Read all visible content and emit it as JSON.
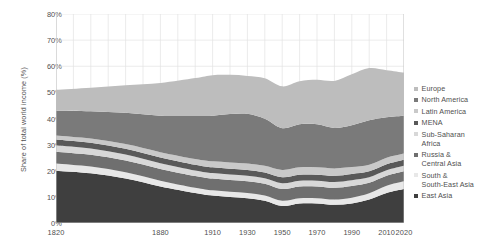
{
  "chart_data": {
    "type": "area",
    "stacked": true,
    "title": "",
    "subtitle": "",
    "xlabel": "",
    "ylabel": "Share of total world income (%)",
    "xlim": [
      1820,
      2020
    ],
    "ylim": [
      0,
      80
    ],
    "grid": true,
    "grid_axes": "both",
    "legend_position": "right",
    "x_tick_labels": [
      "1820",
      "1880",
      "1910",
      "1930",
      "1950",
      "1970",
      "1990",
      "2010",
      "2020"
    ],
    "x_tick_values": [
      1820,
      1880,
      1910,
      1930,
      1950,
      1970,
      1990,
      2010,
      2020
    ],
    "y_tick_labels": [
      "0%",
      "10%",
      "20%",
      "30%",
      "40%",
      "50%",
      "60%",
      "70%",
      "80%"
    ],
    "y_tick_values": [
      0,
      10,
      20,
      30,
      40,
      50,
      60,
      70,
      80
    ],
    "x": [
      1820,
      1840,
      1860,
      1880,
      1900,
      1910,
      1920,
      1930,
      1940,
      1950,
      1960,
      1970,
      1980,
      1990,
      2000,
      2010,
      2020
    ],
    "series": [
      {
        "name": "East Asia",
        "color": "#3f3f3f",
        "values": [
          20.0,
          19.0,
          17.0,
          14.0,
          11.5,
          10.5,
          10.0,
          9.5,
          8.5,
          6.5,
          7.5,
          7.5,
          7.0,
          7.5,
          9.0,
          11.5,
          13.0
        ]
      },
      {
        "name": "South & South-East Asia",
        "color": "#e8e8e8",
        "values": [
          2.8,
          2.6,
          2.4,
          2.2,
          2.0,
          2.0,
          2.0,
          2.0,
          2.0,
          2.0,
          2.0,
          2.0,
          2.0,
          2.2,
          2.4,
          2.8,
          3.0
        ]
      },
      {
        "name": "Russia & Central Asia",
        "color": "#6f6f6f",
        "values": [
          4.5,
          4.5,
          4.5,
          4.5,
          4.5,
          4.5,
          4.5,
          4.5,
          4.5,
          4.5,
          4.5,
          4.5,
          4.5,
          4.5,
          4.0,
          3.8,
          3.8
        ]
      },
      {
        "name": "Sub-Saharan Africa",
        "color": "#d8d8d8",
        "values": [
          2.5,
          2.4,
          2.3,
          2.2,
          2.1,
          2.1,
          2.1,
          2.1,
          2.1,
          2.2,
          2.2,
          2.2,
          2.2,
          2.2,
          2.1,
          2.1,
          2.1
        ]
      },
      {
        "name": "MENA",
        "color": "#595959",
        "values": [
          2.2,
          2.2,
          2.2,
          2.2,
          2.2,
          2.2,
          2.2,
          2.2,
          2.2,
          2.3,
          2.3,
          2.3,
          2.4,
          2.4,
          2.3,
          2.3,
          2.3
        ]
      },
      {
        "name": "Latin America",
        "color": "#c9c9c9",
        "values": [
          1.5,
          1.6,
          1.8,
          2.0,
          2.2,
          2.3,
          2.4,
          2.5,
          2.6,
          2.8,
          2.8,
          2.8,
          2.8,
          2.6,
          2.5,
          2.5,
          2.4
        ]
      },
      {
        "name": "North America",
        "color": "#7a7a7a",
        "values": [
          9.5,
          10.5,
          12.0,
          14.0,
          16.5,
          17.5,
          18.5,
          19.0,
          18.0,
          16.0,
          16.5,
          16.5,
          15.5,
          16.0,
          17.0,
          15.5,
          14.5
        ]
      },
      {
        "name": "Europe",
        "color": "#bdbdbd",
        "values": [
          8.0,
          9.0,
          10.5,
          12.5,
          14.5,
          15.5,
          15.0,
          14.5,
          15.5,
          16.0,
          16.5,
          17.0,
          18.0,
          19.5,
          20.0,
          18.0,
          16.5
        ]
      }
    ],
    "totals_note": "Stacked bands sum to roughly 51% at 1820, dipping near 47% around 1930, peaking near 60% around 2000 and ending near 55% at 2020."
  },
  "legend": {
    "items": [
      {
        "label": "Europe",
        "color": "#bdbdbd"
      },
      {
        "label": "North America",
        "color": "#7a7a7a"
      },
      {
        "label": "Latin America",
        "color": "#c9c9c9"
      },
      {
        "label": "MENA",
        "color": "#595959"
      },
      {
        "label": "Sub-Saharan\nAfrica",
        "color": "#d8d8d8"
      },
      {
        "label": "Russia &\nCentral Asia",
        "color": "#6f6f6f"
      },
      {
        "label": "South &\nSouth-East Asia",
        "color": "#e8e8e8"
      },
      {
        "label": "East Asia",
        "color": "#3f3f3f"
      }
    ]
  },
  "axes": {
    "y_title": "Share of total world income (%)",
    "y_ticks": [
      "80%",
      "70%",
      "60%",
      "50%",
      "40%",
      "30%",
      "20%",
      "10%",
      "0%"
    ],
    "x_ticks": [
      "1820",
      "1880",
      "1910",
      "1930",
      "1950",
      "1970",
      "1990",
      "2010",
      "2020"
    ]
  },
  "colors": {
    "grid": "#e3e3e3",
    "axis": "#bfbfbf",
    "text": "#4f4f4f",
    "background": "#ffffff"
  }
}
